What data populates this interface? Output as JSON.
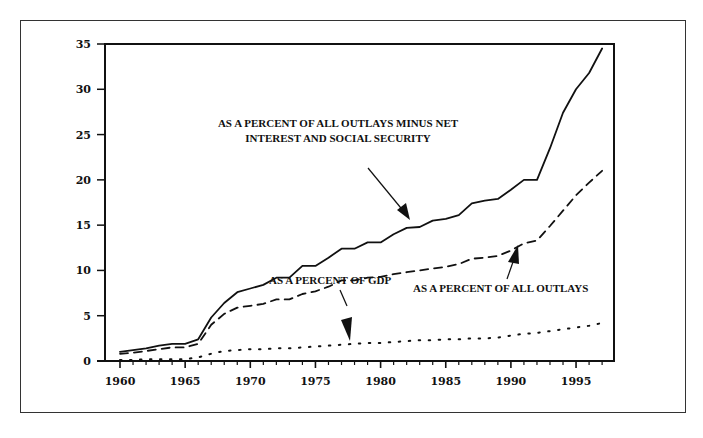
{
  "chart_data": {
    "type": "line",
    "title": "",
    "xlabel": "",
    "ylabel": "",
    "xlim": [
      1959,
      1997
    ],
    "ylim": [
      0,
      35
    ],
    "grid": false,
    "legend": "none (inline annotations with arrows)",
    "x_ticks": [
      1960,
      1965,
      1970,
      1975,
      1980,
      1985,
      1990,
      1995
    ],
    "y_ticks": [
      0,
      5,
      10,
      15,
      20,
      25,
      30,
      35
    ],
    "x": [
      1960,
      1961,
      1962,
      1963,
      1964,
      1965,
      1966,
      1967,
      1968,
      1969,
      1970,
      1971,
      1972,
      1973,
      1974,
      1975,
      1976,
      1977,
      1978,
      1979,
      1980,
      1981,
      1982,
      1983,
      1984,
      1985,
      1986,
      1987,
      1988,
      1989,
      1990,
      1991,
      1992,
      1993,
      1994,
      1995,
      1996,
      1997
    ],
    "series": [
      {
        "name": "As a percent of all outlays minus net interest and social security",
        "style": "solid",
        "values": [
          1.0,
          1.2,
          1.4,
          1.7,
          1.9,
          1.9,
          2.4,
          4.8,
          6.4,
          7.6,
          8.0,
          8.4,
          9.2,
          9.2,
          10.5,
          10.5,
          11.4,
          12.4,
          12.4,
          13.1,
          13.1,
          14.0,
          14.7,
          14.8,
          15.5,
          15.7,
          16.1,
          17.4,
          17.7,
          17.9,
          18.9,
          20.0,
          20.0,
          23.5,
          27.4,
          30.0,
          31.8,
          34.5
        ]
      },
      {
        "name": "As a percent of all outlays",
        "style": "dashed",
        "values": [
          0.8,
          0.9,
          1.1,
          1.3,
          1.5,
          1.5,
          1.9,
          4.0,
          5.2,
          5.9,
          6.1,
          6.3,
          6.8,
          6.8,
          7.4,
          7.7,
          8.2,
          8.9,
          8.9,
          9.2,
          9.3,
          9.6,
          9.8,
          10.0,
          10.2,
          10.4,
          10.7,
          11.3,
          11.4,
          11.6,
          12.2,
          13.0,
          13.3,
          14.9,
          16.6,
          18.3,
          19.7,
          21.0
        ]
      },
      {
        "name": "As a percent of GDP",
        "style": "dotted",
        "values": [
          0.1,
          0.1,
          0.2,
          0.2,
          0.2,
          0.2,
          0.4,
          0.8,
          1.1,
          1.2,
          1.3,
          1.3,
          1.4,
          1.4,
          1.5,
          1.6,
          1.7,
          1.8,
          1.9,
          2.0,
          2.0,
          2.1,
          2.2,
          2.3,
          2.3,
          2.4,
          2.4,
          2.5,
          2.5,
          2.6,
          2.8,
          3.0,
          3.1,
          3.3,
          3.5,
          3.7,
          3.9,
          4.2
        ]
      }
    ],
    "annotations": [
      {
        "text_line1": "AS A PERCENT OF ALL OUTLAYS MINUS NET",
        "text_line2": "INTEREST AND SOCIAL SECURITY",
        "points_to": "solid line near 1983"
      },
      {
        "text": "AS A PERCENT OF ALL OUTLAYS",
        "points_to": "dashed line near 1991"
      },
      {
        "text": "AS A PERCENT OF GDP",
        "points_to": "dotted line near 1977"
      }
    ]
  },
  "labels": {
    "annot_solid_1": "AS A PERCENT OF ALL OUTLAYS MINUS NET",
    "annot_solid_2": "INTEREST AND SOCIAL SECURITY",
    "annot_dashed": "AS A PERCENT OF ALL OUTLAYS",
    "annot_dotted": "AS A PERCENT OF GDP"
  }
}
